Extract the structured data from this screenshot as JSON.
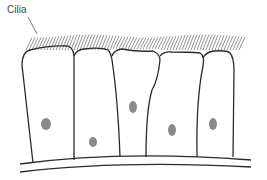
{
  "labels": {
    "cilia": "Cilia"
  },
  "colors": {
    "outline": "#2b2b2b",
    "cilia": "#888888",
    "nucleus": "#8a8a8a"
  },
  "cells": [
    {
      "name": "cell-1",
      "nucleus": {
        "cx": 46,
        "cy": 124,
        "rx": 5,
        "ry": 6
      }
    },
    {
      "name": "cell-2",
      "nucleus": {
        "cx": 93,
        "cy": 142,
        "rx": 4,
        "ry": 5
      }
    },
    {
      "name": "cell-3",
      "nucleus": {
        "cx": 133,
        "cy": 107,
        "rx": 4,
        "ry": 6
      }
    },
    {
      "name": "cell-4",
      "nucleus": {
        "cx": 172,
        "cy": 130,
        "rx": 4,
        "ry": 6
      }
    },
    {
      "name": "cell-5",
      "nucleus": {
        "cx": 213,
        "cy": 124,
        "rx": 4,
        "ry": 6
      }
    }
  ]
}
